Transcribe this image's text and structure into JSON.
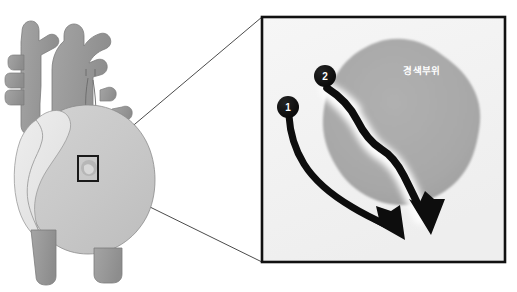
{
  "figure": {
    "background_color": "#ffffff"
  },
  "heart": {
    "name": "anterior view of human heart",
    "colors": {
      "great_vessels": "#9a9a9a",
      "right_ventricle": "#c9c9c9",
      "left_ventricle": "#e2e2e2",
      "atrium_shadow": "#b4b4b4",
      "outline": "#6f6f6f"
    },
    "region_marker": {
      "label": "",
      "border_color": "#1a1a1a"
    }
  },
  "inset": {
    "name": "magnified infarct region",
    "border_color": "#111111",
    "fill_color": "#f2f2f2",
    "infarct_area": {
      "label": "경색부위",
      "fill_color": "#a8a8a8",
      "halo_color": "#fbfbfb"
    },
    "callouts": [
      {
        "number": "1",
        "circle_color": "#0d0d0d",
        "text_color": "#ffffff"
      },
      {
        "number": "2",
        "circle_color": "#0d0d0d",
        "text_color": "#ffffff"
      }
    ],
    "arrows": [
      {
        "name": "arrow-path-1",
        "from_callout": "1",
        "color": "#0d0d0d"
      },
      {
        "name": "arrow-path-2",
        "from_callout": "2",
        "color": "#0d0d0d"
      }
    ]
  },
  "connectors": {
    "name": "magnification guide lines",
    "color": "#2a2a2a",
    "count": 2
  }
}
